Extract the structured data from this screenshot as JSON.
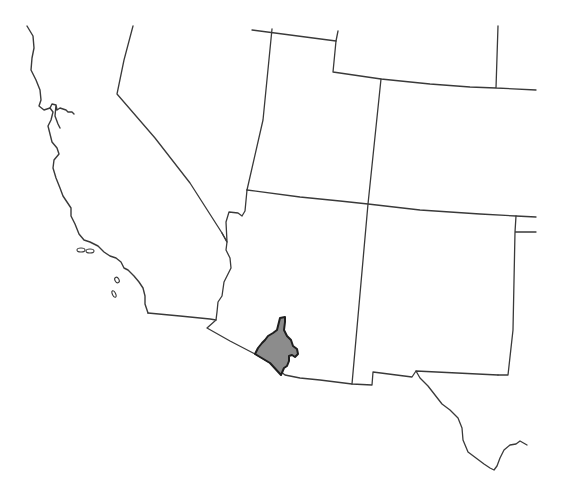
{
  "map": {
    "type": "range map",
    "region": "Southwestern United States",
    "background_color": "#ffffff",
    "border_color": "#3a3a3a",
    "highlight": {
      "label": "highlighted-range",
      "location": "southern Arizona near the Mexico border",
      "fill_color": "#8c8c8c",
      "outline_color": "#1e1e1e"
    },
    "states_shown": [
      "California",
      "Nevada",
      "Utah",
      "Colorado",
      "Arizona",
      "New Mexico",
      "Texas",
      "Wyoming",
      "Kansas",
      "Oklahoma"
    ]
  }
}
